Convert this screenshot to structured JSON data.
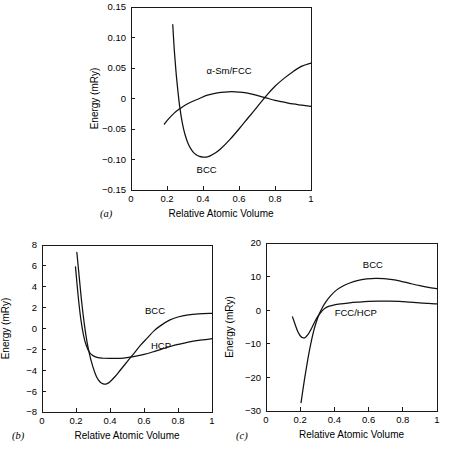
{
  "figure": {
    "background": "#ffffff",
    "line_color": "#111111",
    "panel_labels": [
      "(a)",
      "(b)",
      "(c)"
    ]
  },
  "chart_data": [
    {
      "id": "panel-a",
      "type": "line",
      "panel_label": "(a)",
      "title": "",
      "xlabel": "Relative Atomic Volume",
      "ylabel": "Energy (mRy)",
      "xlim": [
        0,
        1
      ],
      "ylim": [
        -0.15,
        0.15
      ],
      "xticks": [
        0,
        0.2,
        0.4,
        0.6,
        0.8,
        1
      ],
      "xticklabels": [
        "0",
        "0.2",
        "0.4",
        "0.6",
        "0.8",
        "1"
      ],
      "yticks": [
        -0.15,
        -0.1,
        -0.05,
        0,
        0.05,
        0.1,
        0.15
      ],
      "yticklabels": [
        "−0.15",
        "−0.10",
        "−0.05",
        "0",
        "0.05",
        "0.10",
        "0.15"
      ],
      "grid": false,
      "legend_position": "inline-annotations",
      "series": [
        {
          "name": "BCC",
          "label": "BCC",
          "label_x": 0.42,
          "label_y": -0.122,
          "points": [
            [
              0.232,
              0.121
            ],
            [
              0.24,
              0.082
            ],
            [
              0.25,
              0.044
            ],
            [
              0.26,
              0.014
            ],
            [
              0.27,
              -0.012
            ],
            [
              0.285,
              -0.04
            ],
            [
              0.3,
              -0.059
            ],
            [
              0.32,
              -0.076
            ],
            [
              0.34,
              -0.086
            ],
            [
              0.36,
              -0.092
            ],
            [
              0.38,
              -0.095
            ],
            [
              0.4,
              -0.096
            ],
            [
              0.42,
              -0.096
            ],
            [
              0.44,
              -0.094
            ],
            [
              0.47,
              -0.089
            ],
            [
              0.5,
              -0.082
            ],
            [
              0.55,
              -0.067
            ],
            [
              0.6,
              -0.05
            ],
            [
              0.65,
              -0.032
            ],
            [
              0.7,
              -0.014
            ],
            [
              0.75,
              0.004
            ],
            [
              0.8,
              0.02
            ],
            [
              0.85,
              0.033
            ],
            [
              0.9,
              0.044
            ],
            [
              0.95,
              0.053
            ],
            [
              1.0,
              0.058
            ]
          ]
        },
        {
          "name": "alpha-Sm/FCC",
          "label": "α-Sm/FCC",
          "label_x": 0.545,
          "label_y": 0.04,
          "points": [
            [
              0.185,
              -0.042
            ],
            [
              0.21,
              -0.033
            ],
            [
              0.24,
              -0.024
            ],
            [
              0.27,
              -0.017
            ],
            [
              0.3,
              -0.011
            ],
            [
              0.34,
              -0.005
            ],
            [
              0.38,
              0.0
            ],
            [
              0.42,
              0.005
            ],
            [
              0.46,
              0.008
            ],
            [
              0.5,
              0.01
            ],
            [
              0.54,
              0.011
            ],
            [
              0.58,
              0.011
            ],
            [
              0.62,
              0.01
            ],
            [
              0.66,
              0.008
            ],
            [
              0.7,
              0.005
            ],
            [
              0.75,
              0.001
            ],
            [
              0.8,
              -0.003
            ],
            [
              0.85,
              -0.006
            ],
            [
              0.9,
              -0.009
            ],
            [
              0.95,
              -0.011
            ],
            [
              1.0,
              -0.013
            ]
          ]
        }
      ]
    },
    {
      "id": "panel-b",
      "type": "line",
      "panel_label": "(b)",
      "title": "",
      "xlabel": "Relative Atomic Volume",
      "ylabel": "Energy (mRy)",
      "xlim": [
        0,
        1
      ],
      "ylim": [
        -8,
        8
      ],
      "xticks": [
        0,
        0.2,
        0.4,
        0.6,
        0.8,
        1
      ],
      "xticklabels": [
        "0",
        "0.2",
        "0.4",
        "0.6",
        "0.8",
        "1"
      ],
      "yticks": [
        -8,
        -6,
        -4,
        -2,
        0,
        2,
        4,
        6,
        8
      ],
      "yticklabels": [
        "−8",
        "−6",
        "−4",
        "−2",
        "0",
        "2",
        "4",
        "6",
        "8"
      ],
      "grid": false,
      "legend_position": "inline-annotations",
      "series": [
        {
          "name": "BCC",
          "label": "BCC",
          "label_x": 0.665,
          "label_y": 1.35,
          "points": [
            [
              0.205,
              7.3
            ],
            [
              0.215,
              5.6
            ],
            [
              0.225,
              3.9
            ],
            [
              0.235,
              2.3
            ],
            [
              0.25,
              0.3
            ],
            [
              0.265,
              -1.3
            ],
            [
              0.28,
              -2.5
            ],
            [
              0.3,
              -3.7
            ],
            [
              0.32,
              -4.6
            ],
            [
              0.34,
              -5.1
            ],
            [
              0.36,
              -5.3
            ],
            [
              0.38,
              -5.3
            ],
            [
              0.4,
              -5.1
            ],
            [
              0.43,
              -4.6
            ],
            [
              0.46,
              -4.0
            ],
            [
              0.5,
              -3.2
            ],
            [
              0.54,
              -2.4
            ],
            [
              0.58,
              -1.6
            ],
            [
              0.62,
              -0.9
            ],
            [
              0.66,
              -0.2
            ],
            [
              0.7,
              0.3
            ],
            [
              0.75,
              0.8
            ],
            [
              0.8,
              1.1
            ],
            [
              0.86,
              1.3
            ],
            [
              0.92,
              1.4
            ],
            [
              1.0,
              1.45
            ]
          ]
        },
        {
          "name": "HCP",
          "label": "HCP",
          "label_x": 0.7,
          "label_y": -1.95,
          "points": [
            [
              0.197,
              5.9
            ],
            [
              0.207,
              4.1
            ],
            [
              0.218,
              2.3
            ],
            [
              0.23,
              0.7
            ],
            [
              0.245,
              -0.7
            ],
            [
              0.26,
              -1.6
            ],
            [
              0.28,
              -2.3
            ],
            [
              0.3,
              -2.6
            ],
            [
              0.33,
              -2.8
            ],
            [
              0.36,
              -2.85
            ],
            [
              0.4,
              -2.87
            ],
            [
              0.44,
              -2.87
            ],
            [
              0.48,
              -2.83
            ],
            [
              0.52,
              -2.75
            ],
            [
              0.56,
              -2.63
            ],
            [
              0.6,
              -2.48
            ],
            [
              0.65,
              -2.25
            ],
            [
              0.7,
              -2.0
            ],
            [
              0.75,
              -1.75
            ],
            [
              0.8,
              -1.53
            ],
            [
              0.86,
              -1.3
            ],
            [
              0.92,
              -1.13
            ],
            [
              1.0,
              -0.98
            ]
          ]
        }
      ]
    },
    {
      "id": "panel-c",
      "type": "line",
      "panel_label": "(c)",
      "title": "",
      "xlabel": "Relative Atomic Volume",
      "ylabel": "Energy (mRy)",
      "xlim": [
        0,
        1
      ],
      "ylim": [
        -30,
        20
      ],
      "xticks": [
        0,
        0.2,
        0.4,
        0.6,
        0.8,
        1
      ],
      "xticklabels": [
        "0",
        "0.2",
        "0.4",
        "0.6",
        "0.8",
        "1"
      ],
      "yticks": [
        -30,
        -20,
        -10,
        0,
        10,
        20
      ],
      "yticklabels": [
        "−30",
        "−20",
        "−10",
        "0",
        "10",
        "20"
      ],
      "grid": false,
      "legend_position": "inline-annotations",
      "series": [
        {
          "name": "BCC",
          "label": "BCC",
          "label_x": 0.625,
          "label_y": 12.6,
          "points": [
            [
              0.205,
              -27.5
            ],
            [
              0.215,
              -24.0
            ],
            [
              0.23,
              -19.0
            ],
            [
              0.245,
              -14.5
            ],
            [
              0.26,
              -10.5
            ],
            [
              0.275,
              -7.0
            ],
            [
              0.29,
              -4.2
            ],
            [
              0.31,
              -1.3
            ],
            [
              0.33,
              0.8
            ],
            [
              0.35,
              2.5
            ],
            [
              0.38,
              4.4
            ],
            [
              0.41,
              5.9
            ],
            [
              0.45,
              7.2
            ],
            [
              0.49,
              8.1
            ],
            [
              0.54,
              8.9
            ],
            [
              0.59,
              9.3
            ],
            [
              0.64,
              9.5
            ],
            [
              0.69,
              9.4
            ],
            [
              0.74,
              9.1
            ],
            [
              0.79,
              8.6
            ],
            [
              0.84,
              8.0
            ],
            [
              0.9,
              7.3
            ],
            [
              0.95,
              6.8
            ],
            [
              1.0,
              6.4
            ]
          ]
        },
        {
          "name": "FCC/HCP",
          "label": "FCC/HCP",
          "label_x": 0.525,
          "label_y": -1.6,
          "points": [
            [
              0.155,
              -2.0
            ],
            [
              0.17,
              -4.2
            ],
            [
              0.185,
              -6.3
            ],
            [
              0.2,
              -7.6
            ],
            [
              0.215,
              -8.2
            ],
            [
              0.23,
              -8.1
            ],
            [
              0.245,
              -7.3
            ],
            [
              0.26,
              -6.0
            ],
            [
              0.275,
              -4.5
            ],
            [
              0.29,
              -3.0
            ],
            [
              0.305,
              -1.7
            ],
            [
              0.325,
              -0.4
            ],
            [
              0.345,
              0.6
            ],
            [
              0.37,
              1.2
            ],
            [
              0.4,
              1.6
            ],
            [
              0.44,
              1.9
            ],
            [
              0.49,
              2.2
            ],
            [
              0.54,
              2.4
            ],
            [
              0.6,
              2.6
            ],
            [
              0.66,
              2.7
            ],
            [
              0.72,
              2.7
            ],
            [
              0.78,
              2.6
            ],
            [
              0.84,
              2.4
            ],
            [
              0.9,
              2.2
            ],
            [
              0.95,
              2.0
            ],
            [
              1.0,
              1.9
            ]
          ]
        }
      ]
    }
  ]
}
